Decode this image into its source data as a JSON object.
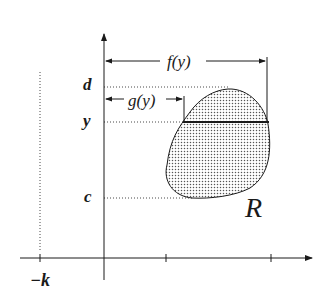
{
  "figure": {
    "labels": {
      "d": "d",
      "y": "y",
      "c": "c",
      "neg_k": "−k",
      "f_of_y": "f(y)",
      "g_of_y": "g(y)",
      "region": "R"
    },
    "colors": {
      "ink": "#1a1a1a",
      "dot": "#555555",
      "background": "#ffffff"
    }
  }
}
